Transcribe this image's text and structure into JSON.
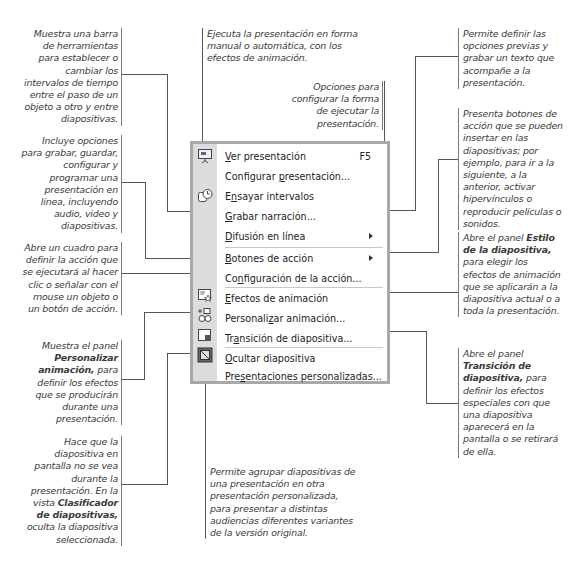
{
  "menu": {
    "items": [
      {
        "label": "Ver presentación",
        "mnemonic": "V",
        "shortcut": "F5",
        "icon": "slideshow-icon"
      },
      {
        "label": "Configurar presentación...",
        "mnemonic": "p"
      },
      {
        "label": "Ensayar intervalos",
        "mnemonic": "n",
        "icon": "rehearse-timings-icon"
      },
      {
        "label": "Grabar narración...",
        "mnemonic": "G"
      },
      {
        "label": "Difusión en línea",
        "mnemonic": "D",
        "submenu": true
      },
      {
        "label": "Botones de acción",
        "mnemonic": "B",
        "submenu": true
      },
      {
        "label": "Configuración de la acción...",
        "mnemonic": "n"
      },
      {
        "label": "Efectos de animación",
        "mnemonic": "E",
        "icon": "animation-schemes-icon"
      },
      {
        "label": "Personalizar animación...",
        "mnemonic": "z",
        "icon": "custom-animation-icon"
      },
      {
        "label": "Transición de diapositiva...",
        "mnemonic": "a",
        "icon": "slide-transition-icon"
      },
      {
        "label": "Ocultar diapositiva",
        "mnemonic": "O",
        "icon": "hide-slide-icon"
      },
      {
        "label": "Presentaciones personalizadas...",
        "mnemonic": "s"
      }
    ]
  },
  "notes": {
    "ver_presentacion": "Ejecuta la presentación en forma manual o automática, con los efectos de animación.",
    "configurar": "Opciones para configurar la forma de ejecutar la presentación.",
    "ensayar": "Muestra una barra de herramientas para establecer o cambiar los intervalos de tiempo entre el paso de un objeto a otro y entre diapositivas.",
    "difusion": "Incluye opciones para grabar, guardar, configurar y programar una presentación en línea, incluyendo audio, video y diapositivas.",
    "configuracion_accion": "Abre un cuadro para definir la acción que se ejecutará al hacer clic o señalar con el mouse un objeto o un botón de acción.",
    "personalizar_pre": "Muestra el panel",
    "personalizar_bold": "Personalizar animación,",
    "personalizar_post": "para definir los efectos que se producirán durante una presentación.",
    "ocultar_pre": "Hace que la diapositiva en pantalla no se vea durante la presentación. En la vista",
    "ocultar_bold": "Clasificador de diapositivas,",
    "ocultar_post": "oculta la diapositiva seleccionada.",
    "grabar": "Permite definir las opciones previas y grabar un texto que acompañe a la presentación.",
    "botones": "Presenta botones de acción que se pueden insertar en las diapositivas; por ejemplo, para ir a la siguiente, a la anterior, activar hipervínculos o reproducir películas o sonidos.",
    "efectos_pre": "Abre el panel",
    "efectos_bold": "Estilo de la diapositiva,",
    "efectos_post": "para elegir los efectos de animación que se aplicarán a la diapositiva actual o a toda la presentación.",
    "transicion_pre": "Abre el panel",
    "transicion_bold": "Transición de diapositiva,",
    "transicion_post": "para definir los efectos especiales con que una diapositiva aparecerá en la pantalla o se retirará de ella.",
    "personalizadas": "Permite agrupar diapositivas de una presentación en otra presentación personalizada, para presentar a distintas audiencias diferentes variantes de la versión original."
  }
}
